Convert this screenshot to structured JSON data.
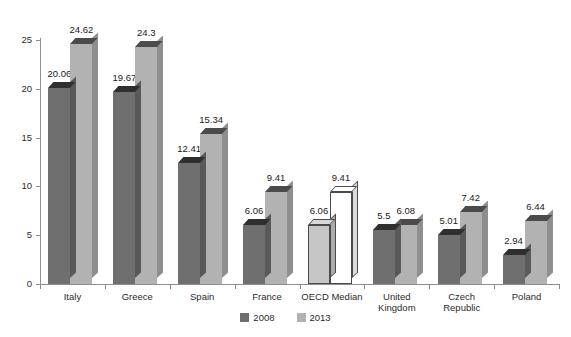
{
  "chart_data": {
    "type": "bar",
    "title": "",
    "subtitle": "",
    "xlabel": "",
    "ylabel": "",
    "ylim": [
      0,
      25
    ],
    "y_ticks": [
      0,
      5,
      10,
      15,
      20,
      25
    ],
    "grid": false,
    "legend_position": "bottom-center",
    "categories": [
      "Italy",
      "Greece",
      "Spain",
      "France",
      "OECD Median",
      "United Kingdom",
      "Czech Republic",
      "Poland"
    ],
    "category_lines": [
      [
        "Italy"
      ],
      [
        "Greece"
      ],
      [
        "Spain"
      ],
      [
        "France"
      ],
      [
        "OECD Median"
      ],
      [
        "United",
        "Kingdom"
      ],
      [
        "Czech",
        "Republic"
      ],
      [
        "Poland"
      ]
    ],
    "series": [
      {
        "name": "2008",
        "color": "#6f6f6f",
        "values": [
          20.06,
          19.67,
          12.41,
          6.06,
          6.06,
          5.5,
          5.01,
          2.94
        ],
        "labels": [
          "20.06",
          "19.67",
          "12.41",
          "6.06",
          "6.06",
          "5.5",
          "5.01",
          "2.94"
        ]
      },
      {
        "name": "2013",
        "color": "#b2b2b2",
        "values": [
          24.62,
          24.3,
          15.34,
          9.41,
          9.41,
          6.08,
          7.42,
          6.44
        ],
        "labels": [
          "24.62",
          "24.3",
          "15.34",
          "9.41",
          "9.41",
          "6.08",
          "7.42",
          "6.44"
        ]
      }
    ],
    "highlighted_category": "OECD Median",
    "highlight_colors": {
      "series_2008": "#c6c6c6",
      "series_2013": "#ffffff"
    }
  },
  "legend": {
    "items": [
      {
        "label": "2008",
        "color": "#6f6f6f"
      },
      {
        "label": "2013",
        "color": "#b2b2b2"
      }
    ]
  }
}
